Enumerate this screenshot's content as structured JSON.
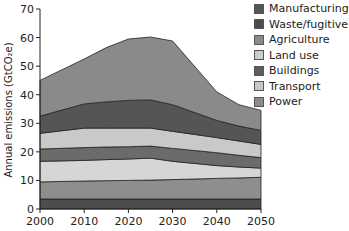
{
  "chart_data": {
    "type": "area",
    "stacked": true,
    "title": "",
    "xlabel": "",
    "ylabel": "Annual emissions (GtCO₂e)",
    "x": [
      2000,
      2010,
      2015,
      2020,
      2025,
      2030,
      2040,
      2045,
      2050
    ],
    "xticks": [
      "2000",
      "2010",
      "2020",
      "2030",
      "2040",
      "2050"
    ],
    "yticks": [
      "0",
      "10",
      "20",
      "30",
      "40",
      "50",
      "60",
      "70"
    ],
    "xlim": [
      2000,
      2050
    ],
    "ylim": [
      0,
      70
    ],
    "grid": false,
    "legend_position": "top-right",
    "cumulative_tops_bottom_up": [
      {
        "layer": 1,
        "color": "#4d4d4d",
        "values": [
          3.5,
          3.5,
          3.5,
          3.5,
          3.5,
          3.5,
          3.5,
          3.5,
          3.5
        ]
      },
      {
        "layer": 2,
        "color": "#8e8e8e",
        "values": [
          9.5,
          9.8,
          9.9,
          10.0,
          10.1,
          10.3,
          10.7,
          10.9,
          11.1
        ]
      },
      {
        "layer": 3,
        "color": "#d6d6d6",
        "values": [
          16.7,
          17.0,
          17.3,
          17.5,
          17.8,
          16.7,
          15.2,
          14.7,
          14.3
        ]
      },
      {
        "layer": 4,
        "color": "#6b6b6b",
        "values": [
          21.0,
          21.5,
          21.7,
          21.8,
          22.0,
          21.2,
          19.7,
          18.8,
          18.0
        ]
      },
      {
        "layer": 5,
        "color": "#c9c9c9",
        "values": [
          26.5,
          28.3,
          28.3,
          28.3,
          28.3,
          27.2,
          25.0,
          23.8,
          22.6
        ]
      },
      {
        "layer": 6,
        "color": "#555555",
        "values": [
          32.5,
          36.8,
          37.5,
          38.0,
          38.2,
          36.5,
          31.0,
          29.0,
          27.5
        ]
      },
      {
        "layer": 7,
        "color": "#8a8a8a",
        "values": [
          45.0,
          52.5,
          56.5,
          59.5,
          60.2,
          58.8,
          41.0,
          36.5,
          34.5
        ]
      }
    ],
    "series": [
      {
        "name": "Manufacturing",
        "values": [
          3.5,
          3.5,
          3.5,
          3.5,
          3.5,
          3.5,
          3.5,
          3.5,
          3.5
        ]
      },
      {
        "name": "Waste/fugitive",
        "values": [
          6.0,
          6.3,
          6.4,
          6.5,
          6.6,
          6.8,
          7.2,
          7.4,
          7.6
        ]
      },
      {
        "name": "Agriculture",
        "values": [
          7.2,
          7.2,
          7.4,
          7.5,
          7.7,
          6.4,
          4.5,
          3.8,
          3.2
        ]
      },
      {
        "name": "Land use",
        "values": [
          4.3,
          4.5,
          4.4,
          4.3,
          4.2,
          4.5,
          4.5,
          4.1,
          3.7
        ]
      },
      {
        "name": "Buildings",
        "values": [
          5.5,
          6.8,
          6.6,
          6.5,
          6.3,
          6.0,
          5.3,
          5.0,
          4.6
        ]
      },
      {
        "name": "Transport",
        "values": [
          6.0,
          8.5,
          9.2,
          9.7,
          9.9,
          9.3,
          6.0,
          5.2,
          4.9
        ]
      },
      {
        "name": "Power",
        "values": [
          12.5,
          15.7,
          19.0,
          21.5,
          22.0,
          22.3,
          10.0,
          7.5,
          7.0
        ]
      }
    ]
  },
  "legend": {
    "items": [
      {
        "label": "Manufacturing",
        "color": "#555555"
      },
      {
        "label": "Waste/fugitive",
        "color": "#4a4a4a"
      },
      {
        "label": "Agriculture",
        "color": "#8a8a8a"
      },
      {
        "label": "Land use",
        "color": "#cccccc"
      },
      {
        "label": "Buildings",
        "color": "#5e5e5e"
      },
      {
        "label": "Transport",
        "color": "#c8c8c8"
      },
      {
        "label": "Power",
        "color": "#8a8a8a"
      }
    ]
  },
  "axes": {
    "ylabel": "Annual emissions (GtCO₂e)"
  }
}
